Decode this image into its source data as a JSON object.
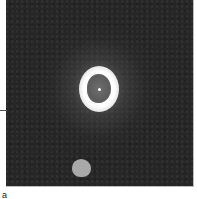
{
  "figure": {
    "panel_background_color": "#262626",
    "ring_color": "#ffffff",
    "core_color": "#626262",
    "secondary_source_color": "#a9a9a9",
    "caption_fragment": "a"
  }
}
